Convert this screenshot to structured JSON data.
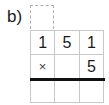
{
  "label": "b)",
  "carry_box": "",
  "rows": [
    [
      "1",
      "5",
      "1"
    ],
    [
      "×",
      "",
      "5"
    ],
    [
      "",
      "",
      ""
    ]
  ]
}
